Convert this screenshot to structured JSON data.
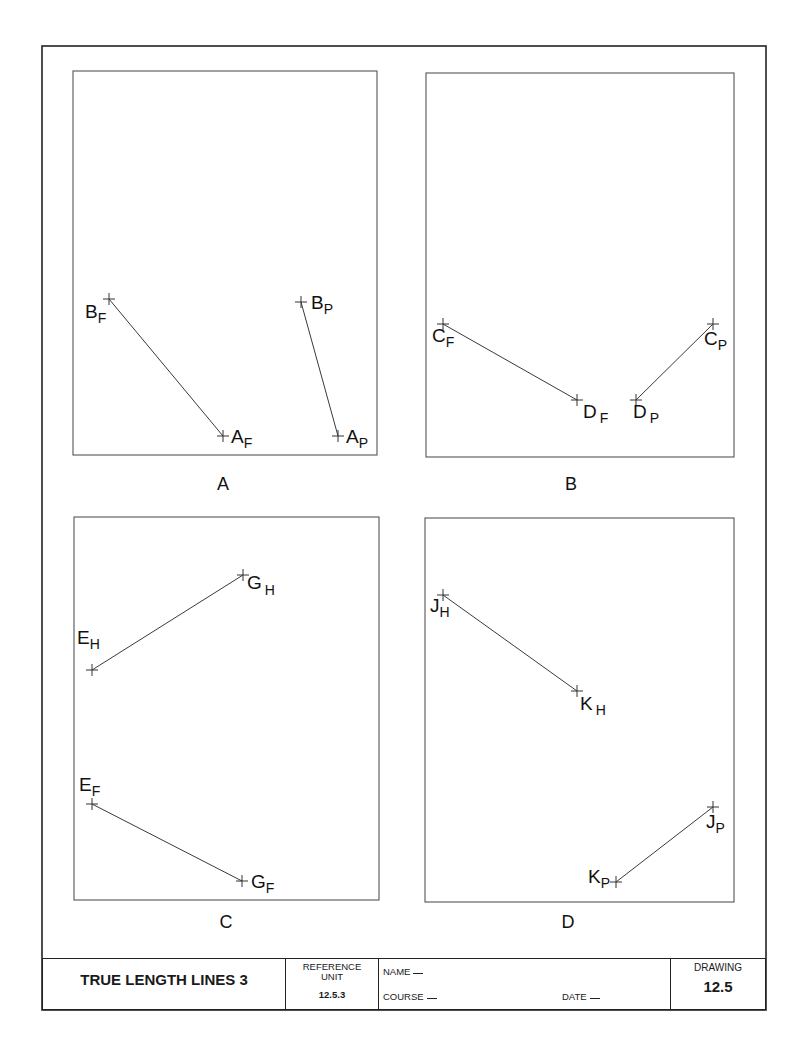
{
  "sheet": {
    "title": "TRUE LENGTH LINES 3",
    "reference_unit_label": "REFERENCE UNIT",
    "reference_unit_line1": "REFERENCE",
    "reference_unit_line2": "UNIT",
    "reference_unit_value": "12.5.3",
    "name_label": "NAME",
    "course_label": "COURSE",
    "date_label": "DATE",
    "drawing_label": "DRAWING",
    "drawing_number": "12.5"
  },
  "panels": [
    {
      "id": "A",
      "caption": "A",
      "points": [
        {
          "letter": "B",
          "sub": "F"
        },
        {
          "letter": "A",
          "sub": "F"
        },
        {
          "letter": "B",
          "sub": "P"
        },
        {
          "letter": "A",
          "sub": "P"
        }
      ]
    },
    {
      "id": "B",
      "caption": "B",
      "points": [
        {
          "letter": "C",
          "sub": "F"
        },
        {
          "letter": "D",
          "sub": "F"
        },
        {
          "letter": "C",
          "sub": "P"
        },
        {
          "letter": "D",
          "sub": "P"
        }
      ]
    },
    {
      "id": "C",
      "caption": "C",
      "points": [
        {
          "letter": "E",
          "sub": "H"
        },
        {
          "letter": "G",
          "sub": "H"
        },
        {
          "letter": "E",
          "sub": "F"
        },
        {
          "letter": "G",
          "sub": "F"
        }
      ]
    },
    {
      "id": "D",
      "caption": "D",
      "points": [
        {
          "letter": "J",
          "sub": "H"
        },
        {
          "letter": "K",
          "sub": "H"
        },
        {
          "letter": "J",
          "sub": "P"
        },
        {
          "letter": "K",
          "sub": "P"
        }
      ]
    }
  ]
}
